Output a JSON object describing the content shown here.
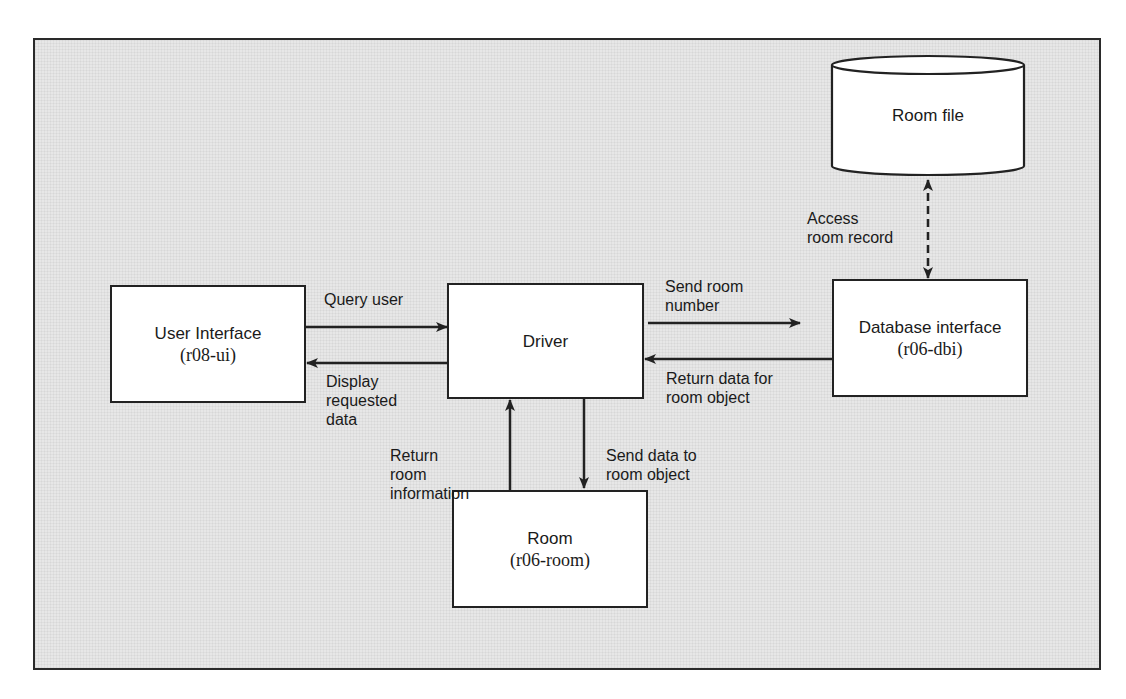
{
  "diagram": {
    "type": "module-interaction",
    "nodes": {
      "user_interface": {
        "title": "User Interface",
        "module": "(r08-ui)"
      },
      "driver": {
        "title": "Driver"
      },
      "database_interface": {
        "title": "Database interface",
        "module": "(r06-dbi)"
      },
      "room": {
        "title": "Room",
        "module": "(r06-room)"
      },
      "room_file": {
        "title": "Room file",
        "shape": "cylinder"
      }
    },
    "edges": {
      "query_user": {
        "from": "user_interface",
        "to": "driver",
        "label": "Query user"
      },
      "display_requested": {
        "from": "driver",
        "to": "user_interface",
        "label": "Display\nrequested\ndata"
      },
      "send_room_number": {
        "from": "driver",
        "to": "database_interface",
        "label": "Send room\nnumber"
      },
      "return_data": {
        "from": "database_interface",
        "to": "driver",
        "label": "Return data for\nroom object"
      },
      "send_data_room": {
        "from": "driver",
        "to": "room",
        "label": "Send data to\nroom object"
      },
      "return_room_info": {
        "from": "room",
        "to": "driver",
        "label": "Return\nroom\ninformation"
      },
      "access_room_record": {
        "from": "database_interface",
        "to": "room_file",
        "label": "Access\nroom record",
        "style": "dashed",
        "bidirectional": true
      }
    },
    "colors": {
      "background": "#e7e7e7",
      "box_fill": "#ffffff",
      "stroke": "#222222"
    }
  }
}
